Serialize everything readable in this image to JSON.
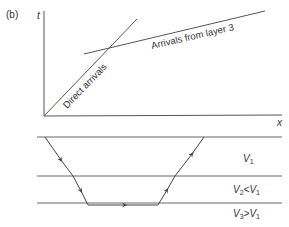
{
  "panel_label": "(b)",
  "graph": {
    "y_axis_label": "t",
    "x_axis_label": "x",
    "lines": [
      {
        "label": "Direct arrivals"
      },
      {
        "label": "Arrivals from layer 3"
      }
    ]
  },
  "layers": [
    {
      "label_main": "V",
      "label_sub": "1",
      "label_rest": ""
    },
    {
      "label_main": "V",
      "label_sub": "2",
      "label_rest": "<V",
      "label_sub2": "1"
    },
    {
      "label_main": "V",
      "label_sub": "3",
      "label_rest": ">V",
      "label_sub2": "1"
    }
  ],
  "colors": {
    "line": "#555555",
    "text": "#333333"
  }
}
